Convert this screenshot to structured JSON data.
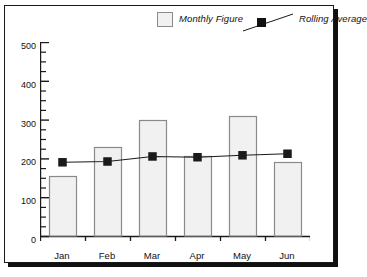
{
  "chart_data": {
    "type": "bar",
    "title": "",
    "subtitle": "",
    "xlabel": "",
    "ylabel": "",
    "ylim": [
      0,
      500
    ],
    "y_ticks": [
      0,
      100,
      200,
      300,
      400,
      500
    ],
    "y_minor_tick_step": 25,
    "grid": false,
    "legend_position": "top-center",
    "categories": [
      "Jan",
      "Feb",
      "Mar",
      "Apr",
      "May",
      "Jun"
    ],
    "series": [
      {
        "name": "Monthly Figure",
        "type": "bar",
        "color": "#f1f1f1",
        "edge_color": "#8a8a8a",
        "values": [
          155,
          230,
          298,
          205,
          310,
          190
        ]
      },
      {
        "name": "Rolling Average",
        "type": "line",
        "color": "#1a1a1a",
        "marker": "square",
        "values": [
          190,
          192,
          205,
          203,
          208,
          212
        ]
      }
    ]
  },
  "legend": {
    "entries": [
      {
        "label": "Monthly Figure",
        "icon": "bar-swatch-icon"
      },
      {
        "label": "Rolling Average",
        "icon": "line-marker-icon"
      }
    ]
  },
  "axes": {
    "y_tick_labels": [
      "500",
      "400",
      "300",
      "200",
      "100",
      "0"
    ],
    "x_tick_labels": [
      "Jan",
      "Feb",
      "Mar",
      "Apr",
      "May",
      "Jun"
    ]
  },
  "colors": {
    "frame": "#1a1a1a",
    "shadow": "#101010",
    "bar_fill": "#f1f1f1",
    "bar_edge": "#8a8a8a",
    "line": "#1a1a1a",
    "background": "#ffffff"
  }
}
